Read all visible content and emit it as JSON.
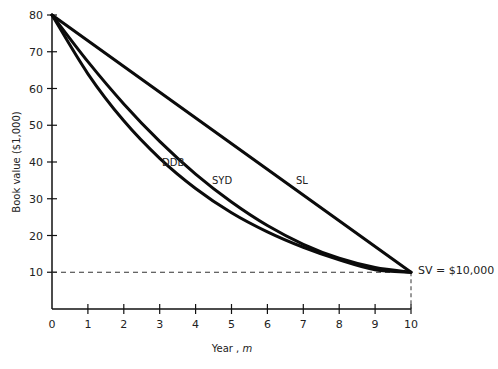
{
  "chart_data": {
    "type": "line",
    "title": "",
    "xlabel": "Year , m",
    "ylabel": "Book value ($1,000)",
    "xlim": [
      0,
      10
    ],
    "ylim": [
      0,
      80
    ],
    "x_ticks": [
      "0",
      "1",
      "2",
      "3",
      "4",
      "5",
      "6",
      "7",
      "8",
      "9",
      "10"
    ],
    "y_ticks": [
      "10",
      "20",
      "30",
      "40",
      "50",
      "60",
      "70",
      "80"
    ],
    "grid": false,
    "legend": "inline labels",
    "x": [
      0,
      1,
      2,
      3,
      4,
      5,
      6,
      7,
      8,
      9,
      10
    ],
    "series": [
      {
        "name": "SL",
        "values": [
          80,
          73,
          66,
          59,
          52,
          45,
          38,
          31,
          24,
          17,
          10
        ]
      },
      {
        "name": "SYD",
        "values": [
          80,
          67.3,
          55.8,
          45.6,
          36.7,
          29.1,
          22.7,
          17.6,
          13.8,
          11.3,
          10
        ]
      },
      {
        "name": "DDB",
        "values": [
          80,
          64,
          51.2,
          41.0,
          32.8,
          26.2,
          21.0,
          16.8,
          13.4,
          10.7,
          10
        ]
      }
    ],
    "annotations": [
      {
        "text": "SV = $10,000",
        "x": 10,
        "y": 10,
        "style": "dashed reference lines to axes"
      }
    ]
  },
  "labels": {
    "ylabel": "Book value ($1,000)",
    "xlabel_prefix": "Year , ",
    "xlabel_var": "m",
    "sv": "SV = $10,000",
    "sl": "SL",
    "syd": "SYD",
    "ddb": "DDB"
  }
}
